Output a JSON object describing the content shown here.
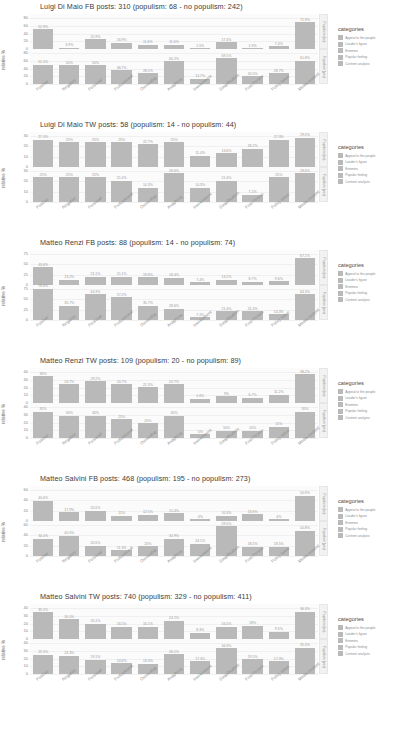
{
  "chart_data": [
    {
      "type": "bar",
      "title": "Luigi Di Maio FB posts: 310 (populism: 68 - no populism: 242)",
      "xlabel": "",
      "ylabel": "relative %",
      "ylim": [
        0,
        80
      ],
      "yticks": [
        0,
        20,
        40,
        60,
        80
      ],
      "grid": true,
      "legend_position": "right",
      "categories": [
        "Positive",
        "Negative",
        "Personal",
        "Professional",
        "Ownership",
        "Anaphora",
        "Involvement",
        "Simplification",
        "First Person",
        "Policy Issue",
        "Media content"
      ],
      "facets": [
        "Populism (no)",
        "Populism (yes)"
      ],
      "series": [
        {
          "name": "Populism (no)",
          "values": [
            52.9,
            3.9,
            25.9,
            16.9,
            11.6,
            11.6,
            2.5,
            17.4,
            1.9,
            7.4,
            71.9
          ],
          "labels": [
            "52.9%",
            "3.9%",
            "25.9%",
            "16.9%",
            "11.6%",
            "11.6%",
            "2.5%",
            "17.4%",
            "1.9%",
            "7.4%",
            "71.9%"
          ]
        },
        {
          "name": "Populism (yes)",
          "values": [
            51.5,
            50.0,
            50.0,
            36.7,
            28.5,
            60.2,
            14.7,
            69.1,
            20.5,
            28.7,
            61.8
          ],
          "labels": [
            "51.5%",
            "50%",
            "50%",
            "36.7%",
            "28.5%",
            "60.2%",
            "14.7%",
            "69.1%",
            "20.5%",
            "28.7%",
            "61.8%"
          ]
        }
      ]
    },
    {
      "type": "bar",
      "title": "Luigi Di Maio TW posts: 58 (populism: 14 - no populism: 44)",
      "xlabel": "",
      "ylabel": "relative %",
      "ylim": [
        0,
        30
      ],
      "yticks": [
        0,
        10,
        20,
        30
      ],
      "grid": true,
      "legend_position": "right",
      "categories": [
        "Positive",
        "Negative",
        "Personal",
        "Professional",
        "Ownership",
        "Anaphora",
        "Involvement",
        "Simplification",
        "First Person",
        "Policy Issue",
        "Media content"
      ],
      "facets": [
        "Populism (no)",
        "Populism (yes)"
      ],
      "series": [
        {
          "name": "Populism (no)",
          "values": [
            27.3,
            25.0,
            25.0,
            25.0,
            22.7,
            25.0,
            11.4,
            13.6,
            18.2,
            27.3,
            29.5
          ],
          "labels": [
            "27.3%",
            "25%",
            "25%",
            "25%",
            "22.7%",
            "25%",
            "11.4%",
            "13.6%",
            "18.2%",
            "27.3%",
            "29.5%"
          ]
        },
        {
          "name": "Populism (yes)",
          "values": [
            25.0,
            25.0,
            25.0,
            21.4,
            14.3,
            28.6,
            14.3,
            21.4,
            7.1,
            25.0,
            28.6
          ],
          "labels": [
            "25%",
            "25%",
            "25%",
            "21.4%",
            "14.3%",
            "28.6%",
            "14.3%",
            "21.4%",
            "7.1%",
            "25%",
            "28.6%"
          ]
        }
      ]
    },
    {
      "type": "bar",
      "title": "Matteo Renzi FB posts: 88 (populism: 14 - no populism: 74)",
      "xlabel": "",
      "ylabel": "relative %",
      "ylim": [
        0,
        75
      ],
      "yticks": [
        0,
        25,
        50,
        75
      ],
      "grid": true,
      "legend_position": "right",
      "categories": [
        "Positive",
        "Negative",
        "Personal",
        "Professional",
        "Ownership",
        "Anaphora",
        "Involvement",
        "Simplification",
        "First Person",
        "Policy Issue",
        "Media content"
      ],
      "facets": [
        "Populism (no)",
        "Populism (yes)"
      ],
      "series": [
        {
          "name": "Populism (no)",
          "values": [
            43.8,
            13.2,
            21.1,
            21.1,
            19.8,
            18.4,
            7.4,
            13.2,
            8.7,
            9.6,
            67.1
          ],
          "labels": [
            "43.8%",
            "13.2%",
            "21.1%",
            "21.1%",
            "19.8%",
            "18.4%",
            "7.4%",
            "13.2%",
            "8.7%",
            "9.6%",
            "67.1%"
          ]
        },
        {
          "name": "Populism (yes)",
          "values": [
            78.6,
            35.7,
            64.3,
            57.2,
            35.7,
            28.6,
            7.1,
            21.4,
            21.4,
            14.3,
            64.3
          ],
          "labels": [
            "78.6%",
            "35.7%",
            "64.3%",
            "57.2%",
            "35.7%",
            "28.6%",
            "7.1%",
            "21.4%",
            "21.4%",
            "14.3%",
            "64.3%"
          ]
        }
      ]
    },
    {
      "type": "bar",
      "title": "Matteo Renzi TW posts: 109 (populism: 20 - no populism: 89)",
      "xlabel": "",
      "ylabel": "relative %",
      "ylim": [
        0,
        40
      ],
      "yticks": [
        0,
        10,
        20,
        30,
        40
      ],
      "grid": true,
      "legend_position": "right",
      "categories": [
        "Positive",
        "Negative",
        "Personal",
        "Professional",
        "Ownership",
        "Anaphora",
        "Involvement",
        "Simplification",
        "First Person",
        "Policy Issue",
        "Media content"
      ],
      "facets": [
        "Populism (no)",
        "Populism (yes)"
      ],
      "series": [
        {
          "name": "Populism (no)",
          "values": [
            36.0,
            24.7,
            29.2,
            24.7,
            21.3,
            24.7,
            5.6,
            9.0,
            6.7,
            11.2,
            38.2
          ],
          "labels": [
            "36%",
            "24.7%",
            "29.2%",
            "24.7%",
            "21.3%",
            "24.7%",
            "5.6%",
            "9%",
            "6.7%",
            "11.2%",
            "38.2%"
          ]
        },
        {
          "name": "Populism (yes)",
          "values": [
            35.0,
            30.0,
            30.0,
            25.0,
            20.0,
            30.0,
            5.0,
            10.0,
            10.0,
            15.0,
            35.0
          ],
          "labels": [
            "35%",
            "30%",
            "30%",
            "25%",
            "20%",
            "30%",
            "5%",
            "10%",
            "10%",
            "15%",
            "35%"
          ]
        }
      ]
    },
    {
      "type": "bar",
      "title": "Matteo Salvini FB posts: 468 (populism: 195 - no populism: 273)",
      "xlabel": "",
      "ylabel": "relative %",
      "ylim": [
        0,
        60
      ],
      "yticks": [
        0,
        20,
        40,
        60
      ],
      "grid": true,
      "legend_position": "right",
      "categories": [
        "Positive",
        "Negative",
        "Personal",
        "Professional",
        "Ownership",
        "Anaphora",
        "Involvement",
        "Simplification",
        "First Person",
        "Policy Issue",
        "Media content"
      ],
      "facets": [
        "Populism (no)",
        "Populism (yes)"
      ],
      "series": [
        {
          "name": "Populism (no)",
          "values": [
            40.6,
            17.9,
            20.5,
            11.0,
            12.5,
            15.4,
            4.0,
            10.3,
            13.6,
            4.0,
            50.9
          ],
          "labels": [
            "40.6%",
            "17.9%",
            "20.5%",
            "11%",
            "12.5%",
            "15.4%",
            "4%",
            "10.3%",
            "13.6%",
            "4%",
            "50.9%"
          ]
        },
        {
          "name": "Populism (yes)",
          "values": [
            34.4,
            40.5,
            20.5,
            11.3,
            20.0,
            34.9,
            24.1,
            59.5,
            18.5,
            18.5,
            50.8
          ],
          "labels": [
            "34.4%",
            "40.5%",
            "20.5%",
            "11.3%",
            "20%",
            "34.9%",
            "24.1%",
            "59.5%",
            "18.5%",
            "18.5%",
            "50.8%"
          ]
        }
      ]
    },
    {
      "type": "bar",
      "title": "Matteo Salvini TW posts: 740 (populism: 329 - no populism: 411)",
      "xlabel": "",
      "ylabel": "relative %",
      "ylim": [
        0,
        40
      ],
      "yticks": [
        0,
        10,
        20,
        30,
        40
      ],
      "grid": true,
      "legend_position": "right",
      "categories": [
        "Positive",
        "Negative",
        "Personal",
        "Professional",
        "Ownership",
        "Anaphora",
        "Involvement",
        "Simplification",
        "First Person",
        "Policy Issue",
        "Media content"
      ],
      "facets": [
        "Populism (no)",
        "Populism (yes)"
      ],
      "series": [
        {
          "name": "Populism (no)",
          "values": [
            35.5,
            26.5,
            20.1,
            16.5,
            16.1,
            24.1,
            8.3,
            16.5,
            18.0,
            9.5,
            36.3
          ],
          "labels": [
            "35.5%",
            "26.5%",
            "20.1%",
            "16.5%",
            "16.1%",
            "24.1%",
            "8.3%",
            "16.5%",
            "18%",
            "9.5%",
            "36.3%"
          ]
        },
        {
          "name": "Populism (yes)",
          "values": [
            25.5,
            24.3,
            19.1,
            14.6,
            13.4,
            26.1,
            17.3,
            34.3,
            19.5,
            17.3,
            35.3
          ],
          "labels": [
            "25.5%",
            "24.3%",
            "19.1%",
            "14.6%",
            "13.4%",
            "26.1%",
            "17.3%",
            "34.3%",
            "19.5%",
            "17.3%",
            "35.3%"
          ]
        }
      ]
    }
  ],
  "legend": {
    "title": "categories",
    "items": [
      {
        "label": "Appeal to the people",
        "color": "#b9b9b9"
      },
      {
        "label": "Leader's figure",
        "color": "#b9b9b9"
      },
      {
        "label": "Enemies",
        "color": "#b9b9b9"
      },
      {
        "label": "Popular feeling",
        "color": "#b9b9b9"
      },
      {
        "label": "Content analysis",
        "color": "#b9b9b9"
      }
    ]
  },
  "colors": {
    "bar": "#b9b9b9",
    "panel_bg": "#fbfbfb",
    "grid": "#f0f0f0",
    "text": "#8a8a8a",
    "title": "#3b3b3b"
  }
}
